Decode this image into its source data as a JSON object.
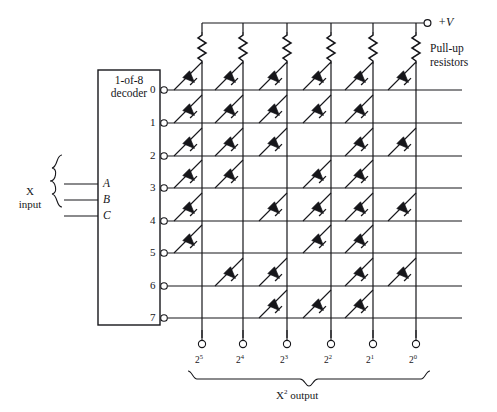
{
  "figure": {
    "type": "diode-matrix-rom-squaring-circuit",
    "decoder": {
      "label_line1": "1-of-8",
      "label_line2": "decoder",
      "outputs": [
        "0",
        "1",
        "2",
        "3",
        "4",
        "5",
        "6",
        "7"
      ],
      "input_pins": [
        "A",
        "B",
        "C"
      ]
    },
    "input_group": {
      "label_line1": "X",
      "label_line2": "input"
    },
    "supply": {
      "label": "+V"
    },
    "pullup": {
      "label_line1": "Pull-up",
      "label_line2": "resistors",
      "count": 6
    },
    "outputs": {
      "group_label_base": "X",
      "group_label_sup": "2",
      "group_label_tail": " output",
      "bits": [
        {
          "base": "2",
          "sup": "5"
        },
        {
          "base": "2",
          "sup": "4"
        },
        {
          "base": "2",
          "sup": "3"
        },
        {
          "base": "2",
          "sup": "2"
        },
        {
          "base": "2",
          "sup": "1"
        },
        {
          "base": "2",
          "sup": "0"
        }
      ]
    },
    "matrix": {
      "rows": 8,
      "cols": 6,
      "note": "1 = diode present at row/column intersection",
      "cells": [
        [
          1,
          1,
          1,
          1,
          1,
          1
        ],
        [
          1,
          1,
          1,
          1,
          1,
          0
        ],
        [
          1,
          1,
          1,
          0,
          1,
          1
        ],
        [
          1,
          1,
          0,
          1,
          1,
          0
        ],
        [
          1,
          0,
          1,
          1,
          1,
          1
        ],
        [
          1,
          0,
          0,
          1,
          1,
          0
        ],
        [
          0,
          1,
          1,
          0,
          1,
          1
        ],
        [
          0,
          0,
          1,
          1,
          1,
          0
        ]
      ]
    },
    "colors": {
      "ink": "#16161a",
      "wire": "#2a2a2e",
      "background": "#ffffff"
    }
  }
}
